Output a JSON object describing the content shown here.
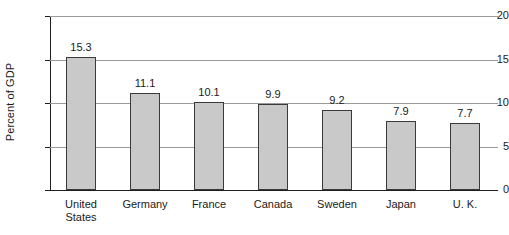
{
  "chart_data": {
    "type": "bar",
    "title": "",
    "xlabel": "",
    "ylabel": "Percent of GDP",
    "ylim": [
      0,
      20
    ],
    "ytick_values": [
      0,
      5,
      10,
      15,
      20
    ],
    "ytick_labels": [
      "0",
      "5",
      "10",
      "15",
      "20"
    ],
    "grid": true,
    "legend": "none",
    "bar_color": "#c9c9c9",
    "bar_border_color": "#3a3a3a",
    "categories": [
      "United\nStates",
      "Germany",
      "France",
      "Canada",
      "Sweden",
      "Japan",
      "U. K."
    ],
    "values": [
      15.3,
      11.1,
      10.1,
      9.9,
      9.2,
      7.9,
      7.7
    ],
    "value_labels": [
      "15.3",
      "11.1",
      "10.1",
      "9.9",
      "9.2",
      "7.9",
      "7.7"
    ]
  }
}
